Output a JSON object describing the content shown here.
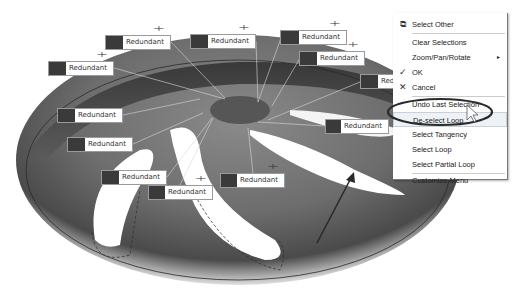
{
  "viewport": {
    "part_description": "3D spoked wheel part with selected loop callouts",
    "accent_color": "#3a3a3a"
  },
  "callouts": [
    {
      "label": "Redundant",
      "x": 105,
      "y": 35
    },
    {
      "label": "Redundant",
      "x": 190,
      "y": 34
    },
    {
      "label": "Redundant",
      "x": 280,
      "y": 30
    },
    {
      "label": "Redundant",
      "x": 299,
      "y": 51
    },
    {
      "label": "Redundant",
      "x": 48,
      "y": 61
    },
    {
      "label": "Redundant",
      "x": 360,
      "y": 74
    },
    {
      "label": "Redundant",
      "x": 57,
      "y": 108
    },
    {
      "label": "Redundant",
      "x": 67,
      "y": 137
    },
    {
      "label": "Redundant",
      "x": 325,
      "y": 119
    },
    {
      "label": "Redundant",
      "x": 101,
      "y": 170
    },
    {
      "label": "Redundant",
      "x": 148,
      "y": 185
    },
    {
      "label": "Redundant",
      "x": 220,
      "y": 173
    }
  ],
  "context_menu": {
    "items": [
      {
        "label": "Select Other",
        "icon": "select-other-icon"
      },
      {
        "label": "Clear Selections"
      },
      {
        "label": "Zoom/Pan/Rotate",
        "submenu": "▸"
      },
      {
        "label": "OK",
        "icon": "check-icon",
        "glyph": "✓"
      },
      {
        "label": "Cancel",
        "icon": "close-icon",
        "glyph": "✕"
      },
      {
        "label": "Undo Last Selection"
      },
      {
        "label": "De-select Loop",
        "highlighted": true
      },
      {
        "label": "Select Tangency"
      },
      {
        "label": "Select Loop"
      },
      {
        "label": "Select Partial Loop"
      },
      {
        "label": "Customize Menu"
      }
    ]
  }
}
